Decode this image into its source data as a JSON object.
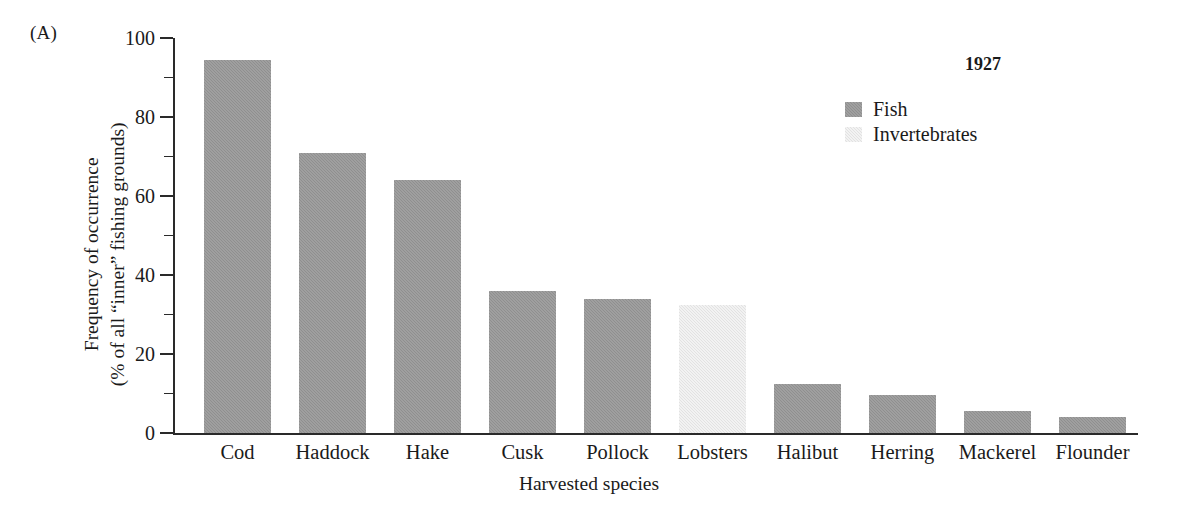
{
  "panel": {
    "label": "(A)"
  },
  "chart_data": {
    "type": "bar",
    "title": "",
    "xlabel": "Harvested species",
    "ylabel_lines": [
      "Frequency of occurrence",
      "(% of all “inner” fishing grounds)"
    ],
    "categories": [
      "Cod",
      "Haddock",
      "Hake",
      "Cusk",
      "Pollock",
      "Lobsters",
      "Halibut",
      "Herring",
      "Mackerel",
      "Flounder"
    ],
    "values": [
      94.5,
      71,
      64,
      36,
      34,
      32.5,
      12.5,
      9.5,
      5.5,
      4
    ],
    "groups": [
      "Fish",
      "Fish",
      "Fish",
      "Fish",
      "Fish",
      "Invertebrates",
      "Fish",
      "Fish",
      "Fish",
      "Fish"
    ],
    "ylim": [
      0,
      100
    ],
    "ytick_major": [
      0,
      20,
      40,
      60,
      80,
      100
    ],
    "ytick_minor": [
      10,
      30,
      50,
      70,
      90
    ],
    "ytick_labels": [
      "0",
      "20",
      "40",
      "60",
      "80",
      "100"
    ],
    "grid": false,
    "legend_position": "top-right",
    "legend_title": "1927",
    "legend_entries": [
      {
        "label": "Fish",
        "color": "#8f8f8f"
      },
      {
        "label": "Invertebrates",
        "color": "#e2e2e2"
      }
    ],
    "colors": {
      "fish": "#8f8f8f",
      "invertebrates": "#e2e2e2",
      "axis": "#2a2a2a",
      "text": "#1a1a1a",
      "background": "#ffffff"
    }
  }
}
